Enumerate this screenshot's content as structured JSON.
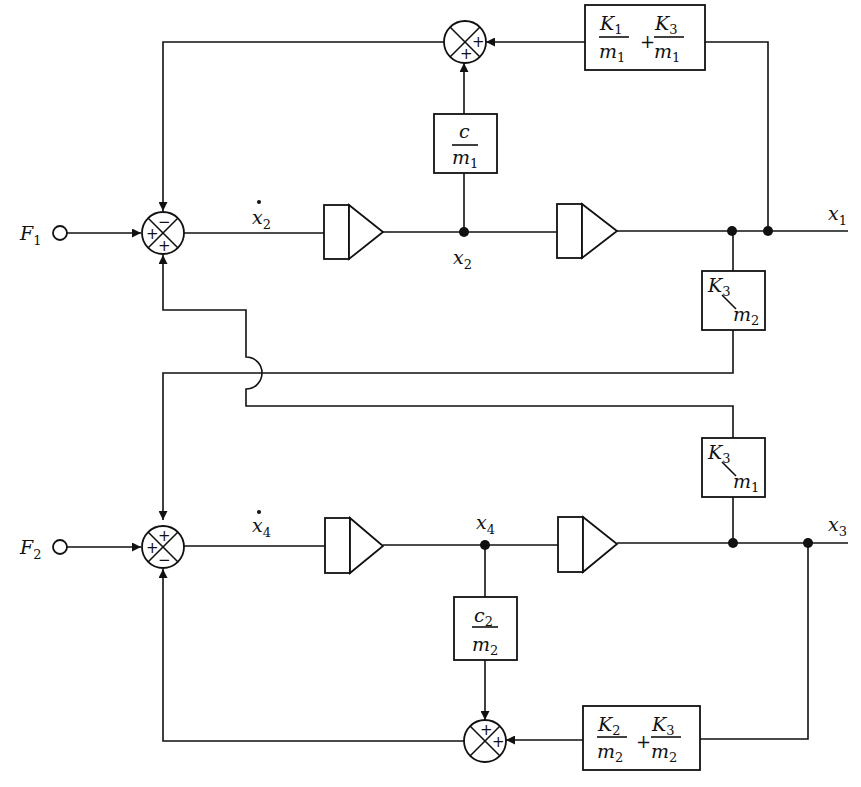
{
  "diagram": {
    "type": "analog-computer block diagram (two-mass system)",
    "inputs": [
      {
        "label": "F",
        "sub": "1"
      },
      {
        "label": "F",
        "sub": "2"
      }
    ],
    "outputs": [
      {
        "label": "x",
        "sub": "1"
      },
      {
        "label": "x",
        "sub": "3"
      }
    ],
    "signals": {
      "x2dot": {
        "label": "x",
        "sub": "2",
        "dot": true
      },
      "x2": {
        "label": "x",
        "sub": "2"
      },
      "x4dot": {
        "label": "x",
        "sub": "4",
        "dot": true
      },
      "x4": {
        "label": "x",
        "sub": "4"
      }
    },
    "summing_junctions": {
      "sum1": {
        "top": "−",
        "left": "+",
        "bottom": "+"
      },
      "sum_top_feedback": {
        "right": "+",
        "bottom": "+"
      },
      "sum2": {
        "top": "+",
        "left": "+",
        "bottom": "−"
      },
      "sum_bottom_feedback": {
        "top": "+",
        "right": "+"
      }
    },
    "gain_blocks": {
      "k1_k3_over_m1": {
        "t1_num": "K",
        "t1_num_sub": "1",
        "t1_den": "m",
        "t1_den_sub": "1",
        "op": "+",
        "t2_num": "K",
        "t2_num_sub": "3",
        "t2_den": "m",
        "t2_den_sub": "1"
      },
      "c_over_m1": {
        "num": "c",
        "num_sub": "",
        "den": "m",
        "den_sub": "1"
      },
      "k3_over_m2": {
        "num": "K",
        "num_sub": "3",
        "slash": "/",
        "den": "m",
        "den_sub": "2"
      },
      "k3_over_m1": {
        "num": "K",
        "num_sub": "3",
        "slash": "/",
        "den": "m",
        "den_sub": "1"
      },
      "c2_over_m2": {
        "num": "c",
        "num_sub": "2",
        "den": "m",
        "den_sub": "2"
      },
      "k2_k3_over_m2": {
        "t1_num": "K",
        "t1_num_sub": "2",
        "t1_den": "m",
        "t1_den_sub": "2",
        "op": "+",
        "t2_num": "K",
        "t2_num_sub": "3",
        "t2_den": "m",
        "t2_den_sub": "2"
      }
    },
    "integrators": [
      "integrator-1",
      "integrator-2",
      "integrator-3",
      "integrator-4"
    ]
  }
}
